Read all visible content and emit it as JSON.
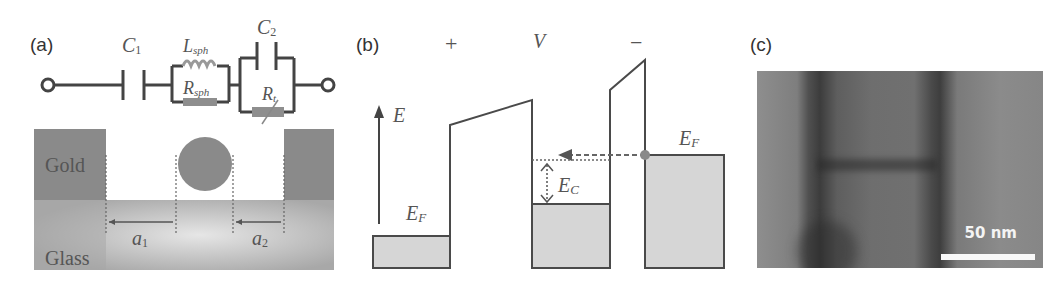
{
  "figure": {
    "panels": [
      {
        "label": "(a)",
        "circuit": {
          "components": [
            {
              "id": "C1",
              "label": "C",
              "sub": "1",
              "type": "capacitor"
            },
            {
              "id": "Lsph",
              "label": "L",
              "sub": "sph",
              "type": "inductor"
            },
            {
              "id": "Rsph",
              "label": "R",
              "sub": "sph",
              "type": "resistor"
            },
            {
              "id": "C2",
              "label": "C",
              "sub": "2",
              "type": "capacitor"
            },
            {
              "id": "Rt",
              "label": "R",
              "sub": "t",
              "type": "variable-resistor"
            }
          ]
        },
        "structure": {
          "gold_label": "Gold",
          "glass_label": "Glass",
          "gap1_label": "a",
          "gap1_sub": "1",
          "gap2_label": "a",
          "gap2_sub": "2"
        }
      },
      {
        "label": "(b)",
        "plus_sign": "+",
        "voltage_label": "V",
        "minus_sign": "−",
        "energy_axis_label": "E",
        "fermi_left_label": "E",
        "fermi_left_sub": "F",
        "fermi_right_label": "E",
        "fermi_right_sub": "F",
        "charging_label": "E",
        "charging_sub": "C"
      },
      {
        "label": "(c)",
        "scale_bar_label": "50 nm"
      }
    ],
    "colors": {
      "line": "#4a4a4a",
      "fill_gray": "#d6d6d6",
      "gold_gray": "#8a8a8a",
      "dot": "#8a8a8a"
    }
  }
}
